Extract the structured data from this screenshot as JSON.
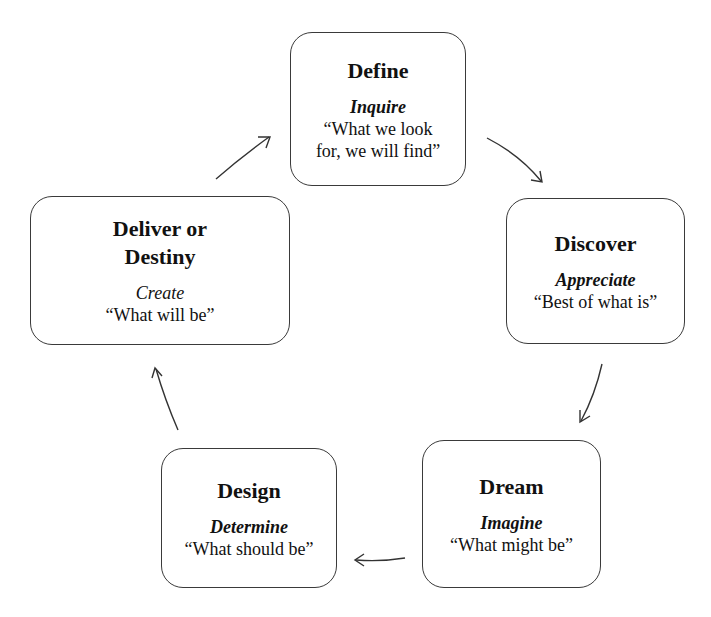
{
  "diagram": {
    "type": "cycle",
    "direction": "clockwise",
    "stages": [
      {
        "id": "define",
        "title": "Define",
        "verb": "Inquire",
        "quote_line1": "“What we look",
        "quote_line2": "for, we will find”"
      },
      {
        "id": "discover",
        "title": "Discover",
        "verb": "Appreciate",
        "quote_line1": "“Best of what is”"
      },
      {
        "id": "dream",
        "title": "Dream",
        "verb": "Imagine",
        "quote_line1": "“What might be”"
      },
      {
        "id": "design",
        "title": "Design",
        "verb": "Determine",
        "quote_line1": "“What should be”"
      },
      {
        "id": "deliver",
        "title_line1": "Deliver or",
        "title_line2": "Destiny",
        "verb": "Create",
        "quote_line1": "“What will be”"
      }
    ],
    "arrows": [
      {
        "from": "define",
        "to": "discover"
      },
      {
        "from": "discover",
        "to": "dream"
      },
      {
        "from": "dream",
        "to": "design"
      },
      {
        "from": "design",
        "to": "deliver"
      },
      {
        "from": "deliver",
        "to": "define"
      }
    ],
    "colors": {
      "stroke": "#3a3a3a",
      "text": "#111111",
      "background": "#ffffff"
    }
  }
}
